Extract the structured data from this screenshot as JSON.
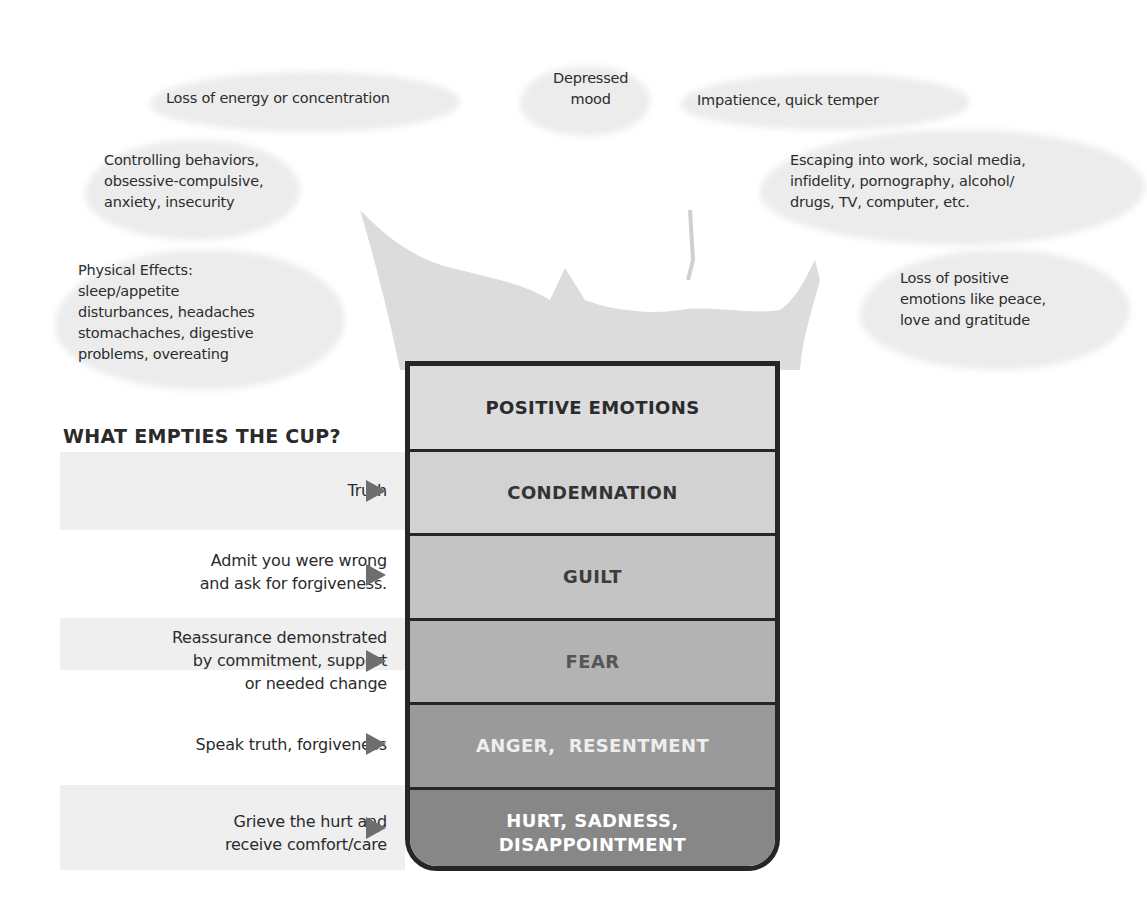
{
  "effects": [
    {
      "id": "energy",
      "text": "Loss of energy or concentration"
    },
    {
      "id": "depressed",
      "text": "Depressed\nmood"
    },
    {
      "id": "impatience",
      "text": "Impatience, quick temper"
    },
    {
      "id": "controlling",
      "text": "Controlling behaviors,\nobsessive-compulsive,\nanxiety, insecurity"
    },
    {
      "id": "escaping",
      "text": "Escaping into work, social media,\ninfidelity, pornography, alcohol/\ndrugs, TV, computer, etc."
    },
    {
      "id": "physical",
      "text": "Physical Effects:\nsleep/appetite\ndisturbances, headaches\nstomachaches, digestive\nproblems, overeating"
    },
    {
      "id": "loss_positive",
      "text": "Loss of positive\nemotions like peace,\nlove and gratitude"
    }
  ],
  "heading": "WHAT EMPTIES THE CUP?",
  "cup": {
    "layers": [
      {
        "label": "POSITIVE EMOTIONS",
        "bg": "#dcdcdc",
        "fg": "#2b2b2b"
      },
      {
        "label": "CONDEMNATION",
        "bg": "#d2d2d2",
        "fg": "#333333"
      },
      {
        "label": "GUILT",
        "bg": "#c4c4c4",
        "fg": "#3c3c3c"
      },
      {
        "label": "FEAR",
        "bg": "#b3b3b3",
        "fg": "#555555"
      },
      {
        "label": "ANGER,  RESENTMENT",
        "bg": "#9a9a9a",
        "fg": "#eeeeee"
      },
      {
        "label": "HURT, SADNESS,\nDISAPPOINTMENT",
        "bg": "#878787",
        "fg": "#ffffff"
      }
    ]
  },
  "remedies": [
    {
      "text": "Truth",
      "target": "CONDEMNATION"
    },
    {
      "text": "Admit you were wrong\nand ask for forgiveness.",
      "target": "GUILT"
    },
    {
      "text": "Reassurance demonstrated\nby commitment, support\nor needed change",
      "target": "FEAR"
    },
    {
      "text": "Speak truth, forgiveness",
      "target": "ANGER, RESENTMENT"
    },
    {
      "text": "Grieve the hurt and\nreceive comfort/care",
      "target": "HURT, SADNESS, DISAPPOINTMENT"
    }
  ],
  "icons": {
    "arrow": "right-triangle-arrow"
  }
}
